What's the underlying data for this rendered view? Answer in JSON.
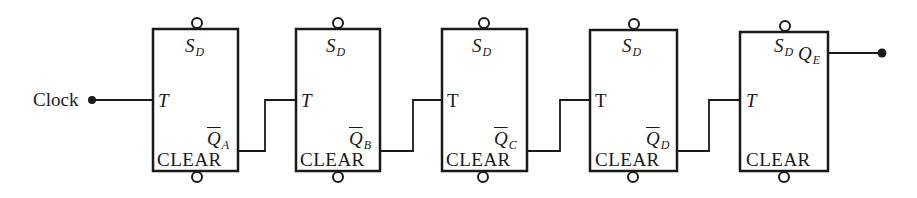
{
  "diagram": {
    "type": "ripple counter (T flip-flops)",
    "input_label": "Clock",
    "colors": {
      "line": "#1a1a1a",
      "background": "#ffffff"
    },
    "flipflops": [
      {
        "id": "A",
        "set_label": "S",
        "set_sub": "D",
        "clock_label": "T",
        "clock_italic": true,
        "output_label": "Q",
        "output_sub": "A",
        "output_inverted": true,
        "clear_label": "CLEAR"
      },
      {
        "id": "B",
        "set_label": "S",
        "set_sub": "D",
        "clock_label": "T",
        "clock_italic": true,
        "output_label": "Q",
        "output_sub": "B",
        "output_inverted": true,
        "clear_label": "CLEAR"
      },
      {
        "id": "C",
        "set_label": "S",
        "set_sub": "D",
        "clock_label": "T",
        "clock_italic": false,
        "output_label": "Q",
        "output_sub": "C",
        "output_inverted": true,
        "clear_label": "CLEAR"
      },
      {
        "id": "D",
        "set_label": "S",
        "set_sub": "D",
        "clock_label": "T",
        "clock_italic": false,
        "output_label": "Q",
        "output_sub": "D",
        "output_inverted": true,
        "clear_label": "CLEAR"
      },
      {
        "id": "E",
        "set_label": "S",
        "set_sub": "D",
        "clock_label": "T",
        "clock_italic": true,
        "output_label": "Q",
        "output_sub": "E",
        "output_inverted": false,
        "clear_label": "CLEAR"
      }
    ]
  }
}
